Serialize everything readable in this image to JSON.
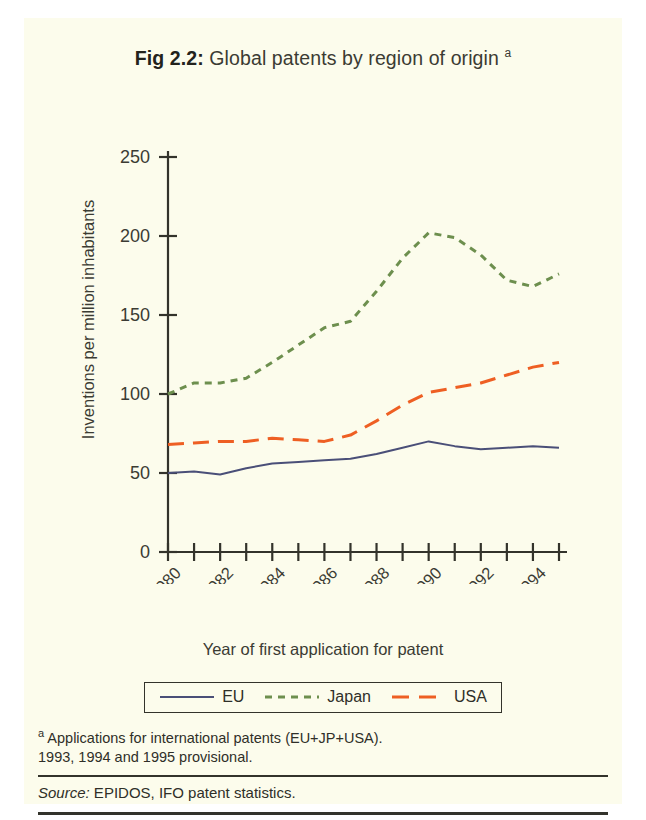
{
  "figure": {
    "number_label": "Fig 2.2:",
    "title_text": " Global patents by region of origin ",
    "title_superscript": "a"
  },
  "chart_data": {
    "type": "line",
    "title": "Fig 2.2: Global patents by region of origin a",
    "xlabel": "Year of first application for patent",
    "ylabel": "Inventions  per million inhabitants",
    "x": [
      1980,
      1981,
      1982,
      1983,
      1984,
      1985,
      1986,
      1987,
      1988,
      1989,
      1990,
      1991,
      1992,
      1993,
      1994,
      1995
    ],
    "xlim": [
      1980,
      1995
    ],
    "ylim": [
      0,
      250
    ],
    "yticks": [
      0,
      50,
      100,
      150,
      200,
      250
    ],
    "xticks": [
      1980,
      1981,
      1982,
      1983,
      1984,
      1985,
      1986,
      1987,
      1988,
      1989,
      1990,
      1991,
      1992,
      1993,
      1994,
      1995
    ],
    "xtick_labels_shown": [
      "1980",
      "1982",
      "1984",
      "1986",
      "1988",
      "1990",
      "1992",
      "1994"
    ],
    "grid": false,
    "legend_position": "bottom",
    "series": [
      {
        "name": "EU",
        "color": "#4a4f78",
        "style": "solid",
        "values": [
          50,
          51,
          49,
          53,
          56,
          57,
          58,
          59,
          62,
          66,
          70,
          67,
          65,
          66,
          67,
          66
        ]
      },
      {
        "name": "Japan",
        "color": "#6d8f4e",
        "style": "dashed-short",
        "values": [
          100,
          107,
          107,
          110,
          120,
          131,
          142,
          146,
          165,
          186,
          202,
          199,
          188,
          172,
          168,
          176
        ]
      },
      {
        "name": "USA",
        "color": "#ee5f23",
        "style": "dashed-long",
        "values": [
          68,
          69,
          70,
          70,
          72,
          71,
          70,
          74,
          83,
          93,
          101,
          104,
          107,
          112,
          117,
          120
        ]
      }
    ]
  },
  "legend": {
    "items": [
      {
        "label": "EU",
        "color": "#4a4f78",
        "style": "solid"
      },
      {
        "label": "Japan",
        "color": "#6d8f4e",
        "style": "dashed-short"
      },
      {
        "label": "USA",
        "color": "#ee5f23",
        "style": "dashed-long"
      }
    ]
  },
  "footnote": {
    "marker": "a",
    "line1": " Applications for international patents (EU+JP+USA).",
    "line2": "1993, 1994 and 1995 provisional."
  },
  "source": {
    "keyword": "Source:",
    "text": " EPIDOS, IFO patent statistics."
  }
}
